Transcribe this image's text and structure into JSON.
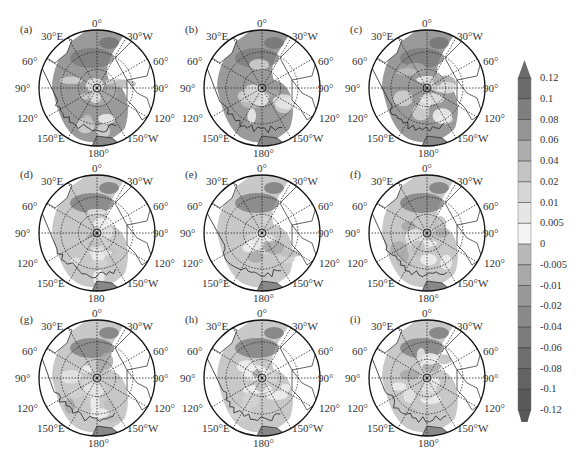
{
  "chart_data": {
    "type": "heatmap",
    "projection": "north-polar-stereographic",
    "title": "",
    "panels": [
      {
        "label": "(a)",
        "bottom_label": "180°"
      },
      {
        "label": "(b)",
        "bottom_label": "180°"
      },
      {
        "label": "(c)",
        "bottom_label": "180°"
      },
      {
        "label": "(d)",
        "bottom_label": "180"
      },
      {
        "label": "(e)",
        "bottom_label": "180°"
      },
      {
        "label": "(f)",
        "bottom_label": "180°"
      },
      {
        "label": "(g)",
        "bottom_label": "180°"
      },
      {
        "label": "(h)",
        "bottom_label": "180°"
      },
      {
        "label": "(i)",
        "bottom_label": "180°"
      }
    ],
    "longitude_labels": {
      "top": "0°",
      "upper_left": "30°E",
      "upper_right": "30°W",
      "left_upper": "60°",
      "right_upper": "60°",
      "left_mid": "90°",
      "right_mid": "90°",
      "left_lower": "120°",
      "right_lower": "120°",
      "lower_left": "150°E",
      "lower_right": "150°W"
    },
    "colorbar": {
      "orientation": "vertical",
      "extend": "both",
      "ticks": [
        "0.12",
        "0.1",
        "0.08",
        "0.06",
        "0.04",
        "0.02",
        "0.01",
        "0.005",
        "0",
        "-0.005",
        "-0.01",
        "-0.02",
        "-0.04",
        "-0.06",
        "-0.08",
        "-0.1",
        "-0.12"
      ],
      "levels": [
        0.12,
        0.1,
        0.08,
        0.06,
        0.04,
        0.02,
        0.01,
        0.005,
        0,
        -0.005,
        -0.01,
        -0.02,
        -0.04,
        -0.06,
        -0.08,
        -0.1,
        -0.12
      ],
      "colors": [
        "#6b6b6b",
        "#7f7f7f",
        "#959595",
        "#adadad",
        "#c4c4c4",
        "#d6d6d6",
        "#e6e6e6",
        "#f4f4f4",
        "#b9b9b9",
        "#a9a9a9",
        "#999999",
        "#8a8a8a",
        "#7c7c7c",
        "#6f6f6f",
        "#636363",
        "#585858"
      ],
      "range": [
        -0.12,
        0.12
      ]
    },
    "grid": "dotted meridians every 30° and latitude circles",
    "legend_position": "right"
  }
}
